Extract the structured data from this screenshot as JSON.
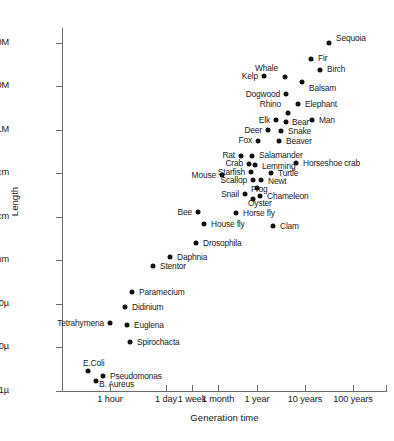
{
  "chart_data": {
    "type": "scatter",
    "title": "",
    "xlabel": "Generation time",
    "ylabel": "Length",
    "grid": false,
    "legend": null,
    "xticklabels": [
      "1 hour",
      "1 day",
      "1 week",
      "1 month",
      "1 year",
      "10 years",
      "100 years"
    ],
    "yticklabels": [
      "100M",
      "10M",
      "1M",
      "10cm",
      "1cm",
      "1mm",
      "100µ",
      "10µ",
      "1µ"
    ],
    "xlim_note": "log scale, minutes to centuries",
    "ylim_note": "log scale, 1 micron to 100 meters",
    "points": [
      {
        "name": "Sequoia",
        "px": 329,
        "py": 43,
        "lx": 336,
        "ly": 38,
        "pos": "right"
      },
      {
        "name": "Fir",
        "px": 311,
        "py": 59,
        "lx": 318,
        "ly": 58,
        "pos": "right"
      },
      {
        "name": "Birch",
        "px": 320,
        "py": 70,
        "lx": 327,
        "ly": 69,
        "pos": "right"
      },
      {
        "name": "Balsam",
        "px": 302,
        "py": 82,
        "lx": 309,
        "ly": 88,
        "pos": "right"
      },
      {
        "name": "Whale",
        "px": 285,
        "py": 77,
        "lx": 278,
        "ly": 68,
        "pos": "left"
      },
      {
        "name": "Kelp",
        "px": 264,
        "py": 76,
        "lx": 258,
        "ly": 76,
        "pos": "left"
      },
      {
        "name": "Dogwood",
        "px": 286,
        "py": 94,
        "lx": 280,
        "ly": 94,
        "pos": "left"
      },
      {
        "name": "Elephant",
        "px": 298,
        "py": 104,
        "lx": 305,
        "ly": 104,
        "pos": "right"
      },
      {
        "name": "Rhino",
        "px": 288,
        "py": 113,
        "lx": 281,
        "ly": 104,
        "pos": "left"
      },
      {
        "name": "Man",
        "px": 312,
        "py": 120,
        "lx": 319,
        "ly": 120,
        "pos": "right"
      },
      {
        "name": "Bear",
        "px": 286,
        "py": 122,
        "lx": 292,
        "ly": 122,
        "pos": "right"
      },
      {
        "name": "Elk",
        "px": 276,
        "py": 120,
        "lx": 270,
        "ly": 120,
        "pos": "left"
      },
      {
        "name": "Snake",
        "px": 281,
        "py": 131,
        "lx": 288,
        "ly": 131,
        "pos": "right"
      },
      {
        "name": "Deer",
        "px": 268,
        "py": 130,
        "lx": 262,
        "ly": 130,
        "pos": "left"
      },
      {
        "name": "Beaver",
        "px": 279,
        "py": 141,
        "lx": 286,
        "ly": 141,
        "pos": "right"
      },
      {
        "name": "Fox",
        "px": 258,
        "py": 141,
        "lx": 252,
        "ly": 140,
        "pos": "left"
      },
      {
        "name": "Salamander",
        "px": 252,
        "py": 156,
        "lx": 259,
        "ly": 155,
        "pos": "right"
      },
      {
        "name": "Rat",
        "px": 241,
        "py": 156,
        "lx": 235,
        "ly": 155,
        "pos": "left"
      },
      {
        "name": "Horseshoe crab",
        "px": 296,
        "py": 163,
        "lx": 303,
        "ly": 163,
        "pos": "right"
      },
      {
        "name": "Lemming",
        "px": 255,
        "py": 165,
        "lx": 262,
        "ly": 166,
        "pos": "right"
      },
      {
        "name": "Crab",
        "px": 249,
        "py": 164,
        "lx": 243,
        "ly": 163,
        "pos": "left"
      },
      {
        "name": "Turtle",
        "px": 271,
        "py": 173,
        "lx": 278,
        "ly": 173,
        "pos": "right"
      },
      {
        "name": "Starfish",
        "px": 251,
        "py": 172,
        "lx": 245,
        "ly": 172,
        "pos": "left"
      },
      {
        "name": "Mouse",
        "px": 222,
        "py": 175,
        "lx": 216,
        "ly": 175,
        "pos": "left"
      },
      {
        "name": "Scallop",
        "px": 253,
        "py": 180,
        "lx": 247,
        "ly": 180,
        "pos": "left"
      },
      {
        "name": "Newt",
        "px": 261,
        "py": 180,
        "lx": 268,
        "ly": 181,
        "pos": "right"
      },
      {
        "name": "Frog",
        "px": 257,
        "py": 188,
        "lx": 251,
        "ly": 189,
        "pos": "right"
      },
      {
        "name": "Chameleon",
        "px": 260,
        "py": 196,
        "lx": 267,
        "ly": 196,
        "pos": "right"
      },
      {
        "name": "Oyster",
        "px": 253,
        "py": 199,
        "lx": 248,
        "ly": 203,
        "pos": "right"
      },
      {
        "name": "Snail",
        "px": 245,
        "py": 194,
        "lx": 239,
        "ly": 194,
        "pos": "left"
      },
      {
        "name": "Horse fly",
        "px": 236,
        "py": 213,
        "lx": 243,
        "ly": 213,
        "pos": "right"
      },
      {
        "name": "Bee",
        "px": 198,
        "py": 212,
        "lx": 192,
        "ly": 212,
        "pos": "left"
      },
      {
        "name": "Clam",
        "px": 273,
        "py": 226,
        "lx": 280,
        "ly": 226,
        "pos": "right"
      },
      {
        "name": "House fly",
        "px": 204,
        "py": 224,
        "lx": 211,
        "ly": 224,
        "pos": "right"
      },
      {
        "name": "Drosophila",
        "px": 196,
        "py": 243,
        "lx": 203,
        "ly": 243,
        "pos": "right"
      },
      {
        "name": "Daphnia",
        "px": 170,
        "py": 257,
        "lx": 177,
        "ly": 257,
        "pos": "right"
      },
      {
        "name": "Stentor",
        "px": 153,
        "py": 266,
        "lx": 160,
        "ly": 266,
        "pos": "right"
      },
      {
        "name": "Paramecium",
        "px": 132,
        "py": 292,
        "lx": 139,
        "ly": 292,
        "pos": "right"
      },
      {
        "name": "Didinium",
        "px": 125,
        "py": 307,
        "lx": 132,
        "ly": 307,
        "pos": "right"
      },
      {
        "name": "Tetrahymena",
        "px": 110,
        "py": 323,
        "lx": 104,
        "ly": 323,
        "pos": "left"
      },
      {
        "name": "Euglena",
        "px": 127,
        "py": 325,
        "lx": 134,
        "ly": 325,
        "pos": "right"
      },
      {
        "name": "Spirochacta",
        "px": 130,
        "py": 342,
        "lx": 137,
        "ly": 342,
        "pos": "right"
      },
      {
        "name": "E.Coli",
        "px": 88,
        "py": 371,
        "lx": 83,
        "ly": 363,
        "pos": "right"
      },
      {
        "name": "Pseudomonas",
        "px": 103,
        "py": 376,
        "lx": 110,
        "ly": 376,
        "pos": "right"
      },
      {
        "name": "B. Aureus",
        "px": 96,
        "py": 381,
        "lx": 99,
        "ly": 384,
        "pos": "right"
      }
    ],
    "ytick_positions": [
      43,
      86,
      130,
      173,
      217,
      260,
      304,
      347,
      391
    ],
    "xtick_positions": [
      110,
      166,
      192,
      218,
      257,
      305,
      353
    ]
  }
}
